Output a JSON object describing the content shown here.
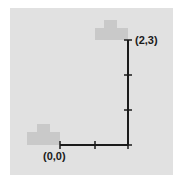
{
  "diagram": {
    "start": {
      "label": "(0,0)",
      "x": 0,
      "y": 0
    },
    "end": {
      "label": "(2,3)",
      "x": 2,
      "y": 3
    },
    "steps": {
      "right": 2,
      "up": 3
    },
    "colors": {
      "page_background": "#ffffff",
      "panel_background": "#e1e1e1",
      "block_fill": "#c9c9c9",
      "path_stroke": "#1a1a1a",
      "label_color": "#1a1a1a"
    }
  }
}
